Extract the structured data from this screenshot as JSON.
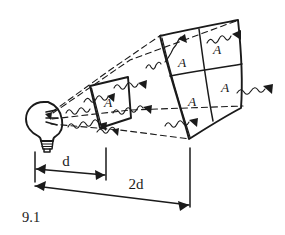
{
  "figure": {
    "caption": "9.1",
    "background_color": "#ffffff",
    "ink_color": "#1a1a1a",
    "style": "hand-drawn sketch"
  },
  "source": {
    "name": "light-bulb",
    "icon": "light-bulb-icon",
    "position": {
      "x": 45,
      "y": 118
    }
  },
  "panels": [
    {
      "id": "near-panel",
      "name": "near-light-panel",
      "distance_label": "d",
      "cells": 1,
      "grid": {
        "rows": 1,
        "cols": 1
      },
      "cell_labels": [
        "A"
      ],
      "total_area_label": "A"
    },
    {
      "id": "far-panel",
      "name": "far-light-panel",
      "distance_label": "2d",
      "cells": 4,
      "grid": {
        "rows": 2,
        "cols": 2
      },
      "cell_labels": [
        "A",
        "A",
        "A",
        "A"
      ],
      "total_area_label": "4A"
    }
  ],
  "cell_labels": {
    "near_1": "A",
    "far_top_left": "A",
    "far_top_right": "A",
    "far_bottom_left": "A",
    "far_bottom_right": "A"
  },
  "dimensions": [
    {
      "id": "dim-d",
      "name": "distance-d",
      "label": "d",
      "label_position": {
        "x": 66,
        "y": 164
      },
      "from": {
        "x": 35,
        "y": 168
      },
      "to": {
        "x": 106,
        "y": 175
      }
    },
    {
      "id": "dim-2d",
      "name": "distance-2d",
      "label": "2d",
      "label_position": {
        "x": 135,
        "y": 188
      },
      "from": {
        "x": 33,
        "y": 185
      },
      "to": {
        "x": 190,
        "y": 205
      }
    }
  ],
  "rays": {
    "name": "wavy-light-rays",
    "count": 9,
    "style": "squiggle with solid arrowhead",
    "description": "wavy arrows representing light radiating outward from the bulb"
  },
  "cone": {
    "name": "dashed-light-cone",
    "style": "dashed",
    "lines": 4,
    "description": "dashed lines from the bulb expanding to the far panel corners"
  }
}
